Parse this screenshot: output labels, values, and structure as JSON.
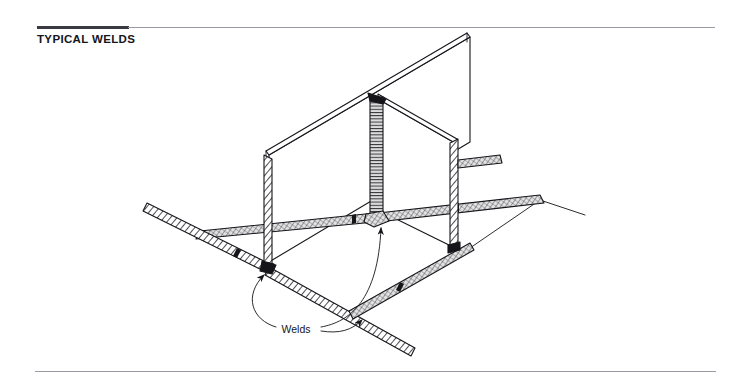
{
  "document": {
    "title": "TYPICAL WELDS",
    "title_rule": {
      "thick_color": "#3a3a42",
      "thin_color": "#9a9aa2"
    },
    "bottom_rule_color": "#9a9aa2",
    "background_color": "#ffffff"
  },
  "figure": {
    "name": "typical-welds-isometric-diagram",
    "line_color": "#15151a",
    "weld_fill_color": "#c8c8c8",
    "annotations": [
      {
        "label": "Welds",
        "x": 296,
        "y": 329,
        "leader_count": 2
      }
    ],
    "elements": [
      {
        "name": "far-plate",
        "type": "vertical-plate"
      },
      {
        "name": "near-plate",
        "type": "vertical-plate"
      },
      {
        "name": "base-plate",
        "type": "horizontal-plate"
      },
      {
        "name": "corner-vertical-weld",
        "type": "weld-bead"
      },
      {
        "name": "left-base-weld",
        "type": "weld-bead"
      },
      {
        "name": "right-base-weld",
        "type": "weld-bead"
      },
      {
        "name": "front-left-base-weld",
        "type": "weld-bead"
      },
      {
        "name": "front-right-base-weld",
        "type": "weld-bead"
      },
      {
        "name": "left-plate-edge-weld",
        "type": "weld-bead"
      },
      {
        "name": "right-plate-edge-weld",
        "type": "weld-bead"
      }
    ]
  }
}
